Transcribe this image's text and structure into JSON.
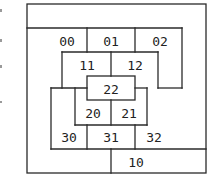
{
  "diagram": {
    "type": "nested-region-partition",
    "stroke_color": "#2a2a2a",
    "background": "#ffffff",
    "cells": [
      {
        "id": "00",
        "label": "00"
      },
      {
        "id": "01",
        "label": "01"
      },
      {
        "id": "02",
        "label": "02"
      },
      {
        "id": "11",
        "label": "11"
      },
      {
        "id": "12",
        "label": "12"
      },
      {
        "id": "22",
        "label": "22"
      },
      {
        "id": "20",
        "label": "20"
      },
      {
        "id": "21",
        "label": "21"
      },
      {
        "id": "30",
        "label": "30"
      },
      {
        "id": "31",
        "label": "31"
      },
      {
        "id": "32",
        "label": "32"
      },
      {
        "id": "10",
        "label": "10"
      }
    ]
  }
}
